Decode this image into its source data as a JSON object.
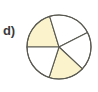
{
  "figure": {
    "label": "d)",
    "kind": "fraction-pie-diagram",
    "background_color": "#ffffff",
    "outline_color": "#5a5a52",
    "shaded_color": "#faf3cc",
    "unshaded_color": "#ffffff",
    "center_x": 59,
    "center_y": 47,
    "radius": 32
  },
  "chart_data": {
    "type": "pie",
    "title": "",
    "subtitle": "",
    "xlabel": "",
    "ylabel": "",
    "grid": false,
    "legend": false,
    "legend_position": "none",
    "annotations": [
      "d)"
    ],
    "total_slices": 5,
    "shaded_slices": 2,
    "unshaded_slices": 3,
    "fraction_shaded": "2/5",
    "categories": [
      "slice-1",
      "slice-2",
      "slice-3",
      "slice-4",
      "slice-5"
    ],
    "values": [
      73,
      80,
      70,
      65,
      72
    ],
    "units": "degrees",
    "slices": [
      {
        "name": "slice-1",
        "start_angle": 180,
        "end_angle": 253,
        "sweep": 73,
        "shaded": true,
        "fill": "#faf3cc"
      },
      {
        "name": "slice-2",
        "start_angle": 253,
        "end_angle": 333,
        "sweep": 80,
        "shaded": false,
        "fill": "#ffffff"
      },
      {
        "name": "slice-3",
        "start_angle": 333,
        "end_angle": 403,
        "sweep": 70,
        "shaded": false,
        "fill": "#ffffff"
      },
      {
        "name": "slice-4",
        "start_angle": 403,
        "end_angle": 468,
        "sweep": 65,
        "shaded": true,
        "fill": "#faf3cc"
      },
      {
        "name": "slice-5",
        "start_angle": 468,
        "end_angle": 540,
        "sweep": 72,
        "shaded": false,
        "fill": "#ffffff"
      }
    ]
  }
}
